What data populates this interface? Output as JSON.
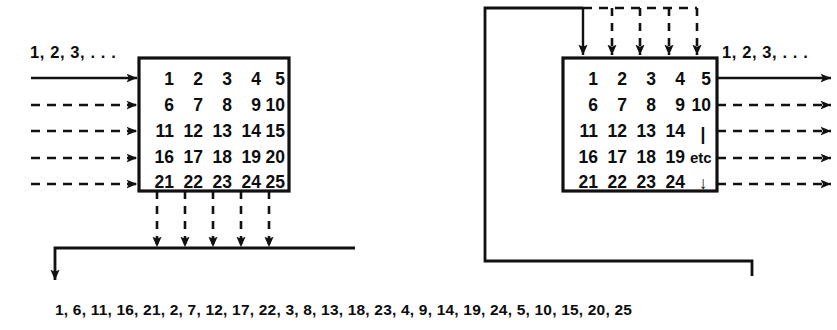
{
  "figure": {
    "ink_color": "#111111",
    "background": "#ffffff"
  },
  "left_diagram": {
    "name": "write-by-rows-read-by-columns",
    "input_label": "1, 2, 3, . . .",
    "matrix": {
      "rows": 5,
      "cols": 5,
      "values": [
        [
          "1",
          "2",
          "3",
          "4",
          "5"
        ],
        [
          "6",
          "7",
          "8",
          "9",
          "10"
        ],
        [
          "11",
          "12",
          "13",
          "14",
          "15"
        ],
        [
          "16",
          "17",
          "18",
          "19",
          "20"
        ],
        [
          "21",
          "22",
          "23",
          "24",
          "25"
        ]
      ]
    },
    "input_arrows": [
      {
        "index": 1,
        "style": "solid",
        "row_value": "1"
      },
      {
        "index": 2,
        "style": "dashed",
        "row_value": "6"
      },
      {
        "index": 3,
        "style": "dashed",
        "row_value": "11"
      },
      {
        "index": 4,
        "style": "dashed",
        "row_value": "16"
      },
      {
        "index": 5,
        "style": "dashed",
        "row_value": "21"
      }
    ],
    "output_arrows": [
      {
        "index": 1,
        "style": "dashed",
        "col_value": "1"
      },
      {
        "index": 2,
        "style": "dashed",
        "col_value": "2"
      },
      {
        "index": 3,
        "style": "dashed",
        "col_value": "3"
      },
      {
        "index": 4,
        "style": "dashed",
        "col_value": "4"
      },
      {
        "index": 5,
        "style": "dashed",
        "col_value": "5"
      }
    ],
    "output_sequence": "1, 6, 11, 16, 21, 2, 7, 12, 17, 22, 3, 8, 13, 18, 23, 4, 9, 14, 19, 24, 5, 10, 15, 20, 25"
  },
  "right_diagram": {
    "name": "write-by-columns-read-by-rows",
    "output_label": "1, 2, 3, . . .",
    "matrix": {
      "rows": 5,
      "cols": 5,
      "values": [
        [
          "1",
          "2",
          "3",
          "4",
          "5"
        ],
        [
          "6",
          "7",
          "8",
          "9",
          "10"
        ],
        [
          "11",
          "12",
          "13",
          "14",
          "|"
        ],
        [
          "16",
          "17",
          "18",
          "19",
          "etc"
        ],
        [
          "21",
          "22",
          "23",
          "24",
          "↓"
        ]
      ]
    },
    "input_arrows": [
      {
        "index": 1,
        "style": "solid",
        "col_value": "1"
      },
      {
        "index": 2,
        "style": "dashed",
        "col_value": "2"
      },
      {
        "index": 3,
        "style": "dashed",
        "col_value": "3"
      },
      {
        "index": 4,
        "style": "dashed",
        "col_value": "4"
      },
      {
        "index": 5,
        "style": "dashed",
        "col_value": "5"
      }
    ],
    "output_arrows": [
      {
        "index": 1,
        "style": "solid",
        "row_value": "5"
      },
      {
        "index": 2,
        "style": "dashed",
        "row_value": "10"
      },
      {
        "index": 3,
        "style": "dashed",
        "row_value": "|"
      },
      {
        "index": 4,
        "style": "dashed",
        "row_value": "etc"
      },
      {
        "index": 5,
        "style": "dashed",
        "row_value": "↓"
      }
    ],
    "feedback_path": "left-vertical-return-bus"
  }
}
